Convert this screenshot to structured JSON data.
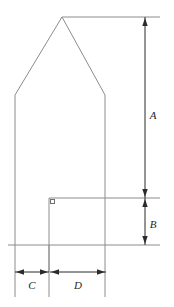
{
  "figure": {
    "background_color": "#ffffff",
    "outline_color": "#8c8c8c",
    "dimension_color": "#2b2b2b",
    "label_color": "#262626"
  },
  "labels": {
    "height_upper": "A",
    "height_lower": "B",
    "width_left": "C",
    "width_right": "D"
  },
  "geometry": {
    "apex": {
      "x": 62,
      "y": 17
    },
    "shoulder_left": {
      "x": 15,
      "y": 95
    },
    "shoulder_right": {
      "x": 105,
      "y": 95
    },
    "wall_bottom_y": 245,
    "inner_corner": {
      "x": 49,
      "y": 198
    },
    "mid_level_y": 198,
    "dimension_line_x": 145,
    "dimension_baseline_y": 272,
    "width_c_from": 15,
    "width_c_to": 49,
    "width_d_from": 50,
    "width_d_to": 106
  },
  "elements": {
    "outline_name": "house-outline",
    "roof_left_name": "roof-slope-left",
    "roof_right_name": "roof-slope-right",
    "wall_left_name": "wall-left",
    "wall_right_name": "wall-right",
    "corner_marker_name": "right-angle-marker",
    "vertical_dim_a_name": "dimension-a",
    "vertical_dim_b_name": "dimension-b",
    "horizontal_dim_c_name": "dimension-c",
    "horizontal_dim_d_name": "dimension-d"
  }
}
